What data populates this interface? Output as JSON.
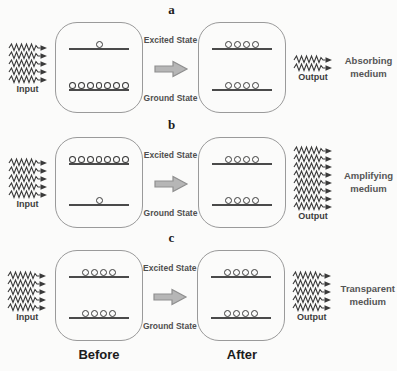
{
  "labels": {
    "input": "Input",
    "output": "Output",
    "excited_state": "Excited State",
    "ground_state": "Ground State",
    "before": "Before",
    "after": "After"
  },
  "colors": {
    "ink": "#3a3a3a",
    "line": "#4a4a4a",
    "box_border": "#9a9a9a",
    "arrow_fill": "#b6b6b6",
    "arrow_stroke": "#8f8f8f",
    "background": "#fbfbfa"
  },
  "rows": [
    {
      "label": "a",
      "medium": "Absorbing medium",
      "input_waves": 5,
      "output_waves": 2,
      "before": {
        "excited": 1,
        "ground": 7
      },
      "after": {
        "excited": 4,
        "ground": 4
      }
    },
    {
      "label": "b",
      "medium": "Amplifying medium",
      "input_waves": 5,
      "output_waves": 8,
      "before": {
        "excited": 7,
        "ground": 1
      },
      "after": {
        "excited": 4,
        "ground": 4
      }
    },
    {
      "label": "c",
      "medium": "Transparent medium",
      "input_waves": 5,
      "output_waves": 5,
      "before": {
        "excited": 4,
        "ground": 4
      },
      "after": {
        "excited": 4,
        "ground": 4
      }
    }
  ]
}
